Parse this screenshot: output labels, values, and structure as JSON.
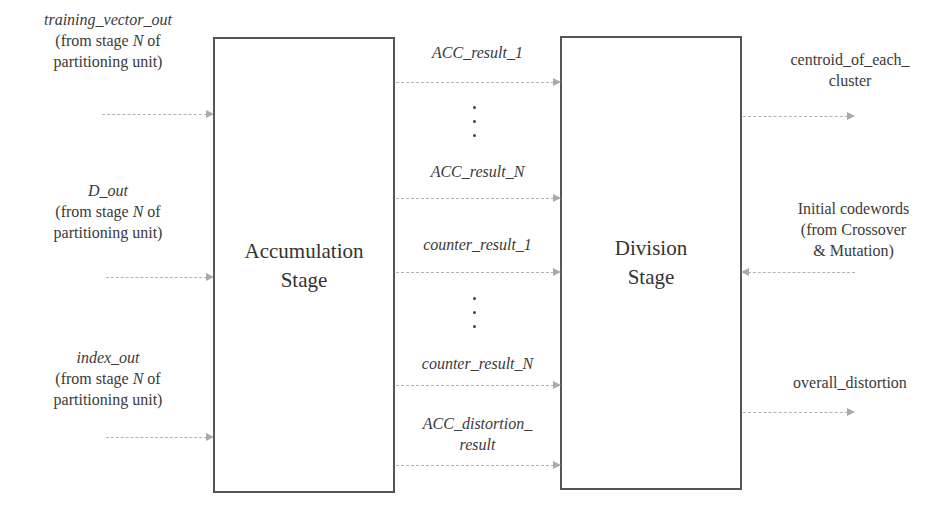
{
  "inputs": [
    {
      "signal": "training_vector_out",
      "note_pre": "(from stage ",
      "note_var": "N",
      "note_post": " of",
      "note_line2": "partitioning unit)"
    },
    {
      "signal": "D_out",
      "note_pre": "(from stage ",
      "note_var": "N",
      "note_post": " of",
      "note_line2": "partitioning unit)"
    },
    {
      "signal": "index_out",
      "note_pre": "(from stage ",
      "note_var": "N",
      "note_post": " of",
      "note_line2": "partitioning unit)"
    }
  ],
  "blocks": {
    "accumulation": {
      "line1": "Accumulation",
      "line2": "Stage"
    },
    "division": {
      "line1": "Division",
      "line2": "Stage"
    }
  },
  "middle_signals": [
    {
      "label": "ACC_result_1"
    },
    {
      "label": "ACC_result_N"
    },
    {
      "label": "counter_result_1"
    },
    {
      "label": "counter_result_N"
    },
    {
      "label_line1": "ACC_distortion_",
      "label_line2": "result"
    }
  ],
  "outputs": {
    "centroid": {
      "line1": "centroid_of_each_",
      "line2": "cluster"
    },
    "initial_codewords": {
      "line1": "Initial codewords",
      "line2": "(from Crossover",
      "line3": "& Mutation)"
    },
    "overall_distortion": {
      "label": "overall_distortion"
    }
  },
  "colors": {
    "box_border": "#555555",
    "arrow": "#aaaaaa",
    "text": "#333333"
  }
}
